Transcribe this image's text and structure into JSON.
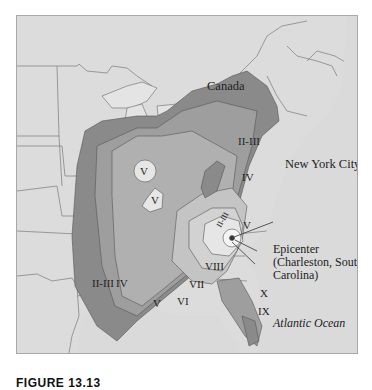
{
  "map": {
    "title": "Intensity map of the Charleston, South Carolina earthquake",
    "background_color": "#dcdcdc",
    "place_labels": {
      "canada": "Canada",
      "new_york_city": "New York City",
      "atlantic_ocean": "Atlantic Ocean",
      "gulf_of_mexico": "Gulf of Mexico"
    },
    "epicenter": {
      "label": "Epicenter\n(Charleston, South\nCarolina)"
    },
    "intensity_zones": {
      "z_ii_iii_north": "II-III",
      "z_ii_iii_west": "II-III",
      "z_ii_iii_inner": "II-III",
      "z_iv_north": "IV",
      "z_iv_west": "IV",
      "z_v_circle1": "V",
      "z_v_circle2": "V",
      "z_v_east": "V",
      "z_v_south": "V",
      "z_vi": "VI",
      "z_vii": "VII",
      "z_viii": "VIII",
      "z_ix": "IX",
      "z_x": "X"
    },
    "zone_colors": {
      "ii_iii": "#8a8a8a",
      "iv": "#9e9e9e",
      "v": "#b0b0b0",
      "vi": "#c4c4c4",
      "vii": "#d2d2d2",
      "viii": "#e6e6e6",
      "ix_x": "#f4f4f4",
      "land": "#dcdcdc",
      "border_lines": "#707070"
    }
  },
  "caption": {
    "figure_label": "FIGURE 13.13",
    "text": ""
  }
}
